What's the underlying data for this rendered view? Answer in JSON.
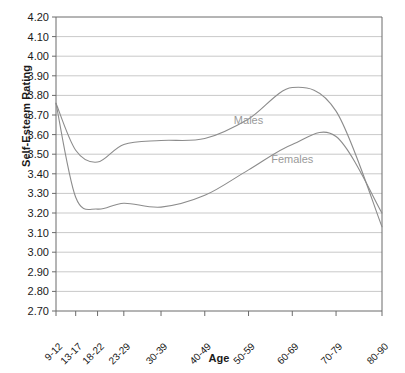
{
  "chart_data": {
    "type": "line",
    "title": "",
    "xlabel": "Age",
    "ylabel": "Self-Esteem Rating",
    "categories": [
      "9-12",
      "13-17",
      "18-22",
      "23-29",
      "30-39",
      "40-49",
      "50-59",
      "60-69",
      "70-79",
      "80-90"
    ],
    "ylim": [
      2.7,
      4.2
    ],
    "ytick_step": 0.1,
    "yticks": [
      "4.20",
      "4.10",
      "4.00",
      "3.90",
      "3.80",
      "3.70",
      "3.60",
      "3.50",
      "3.40",
      "3.30",
      "3.20",
      "3.10",
      "3.00",
      "2.90",
      "2.80",
      "2.70"
    ],
    "grid": true,
    "grid_axis": "y",
    "legend_position": "inline-on-curve",
    "series": [
      {
        "name": "Males",
        "color": "#8c8c8c",
        "values": [
          3.76,
          3.52,
          3.46,
          3.55,
          3.57,
          3.58,
          3.68,
          3.84,
          3.72,
          3.13
        ]
      },
      {
        "name": "Females",
        "color": "#8c8c8c",
        "values": [
          3.76,
          3.28,
          3.22,
          3.25,
          3.23,
          3.29,
          3.42,
          3.55,
          3.59,
          3.2
        ]
      }
    ],
    "annotations": [
      {
        "text": "Males",
        "x_category": "50-59",
        "y_value": 3.655
      },
      {
        "text": "Females",
        "x_category": "60-69",
        "y_value": 3.455
      }
    ]
  },
  "colors": {
    "line": "#8c8c8c",
    "grid": "#c9c9c9",
    "axis": "#6b6b6b",
    "text": "#1a1a1a",
    "series_label": "#9a9a9a",
    "background": "#ffffff"
  }
}
